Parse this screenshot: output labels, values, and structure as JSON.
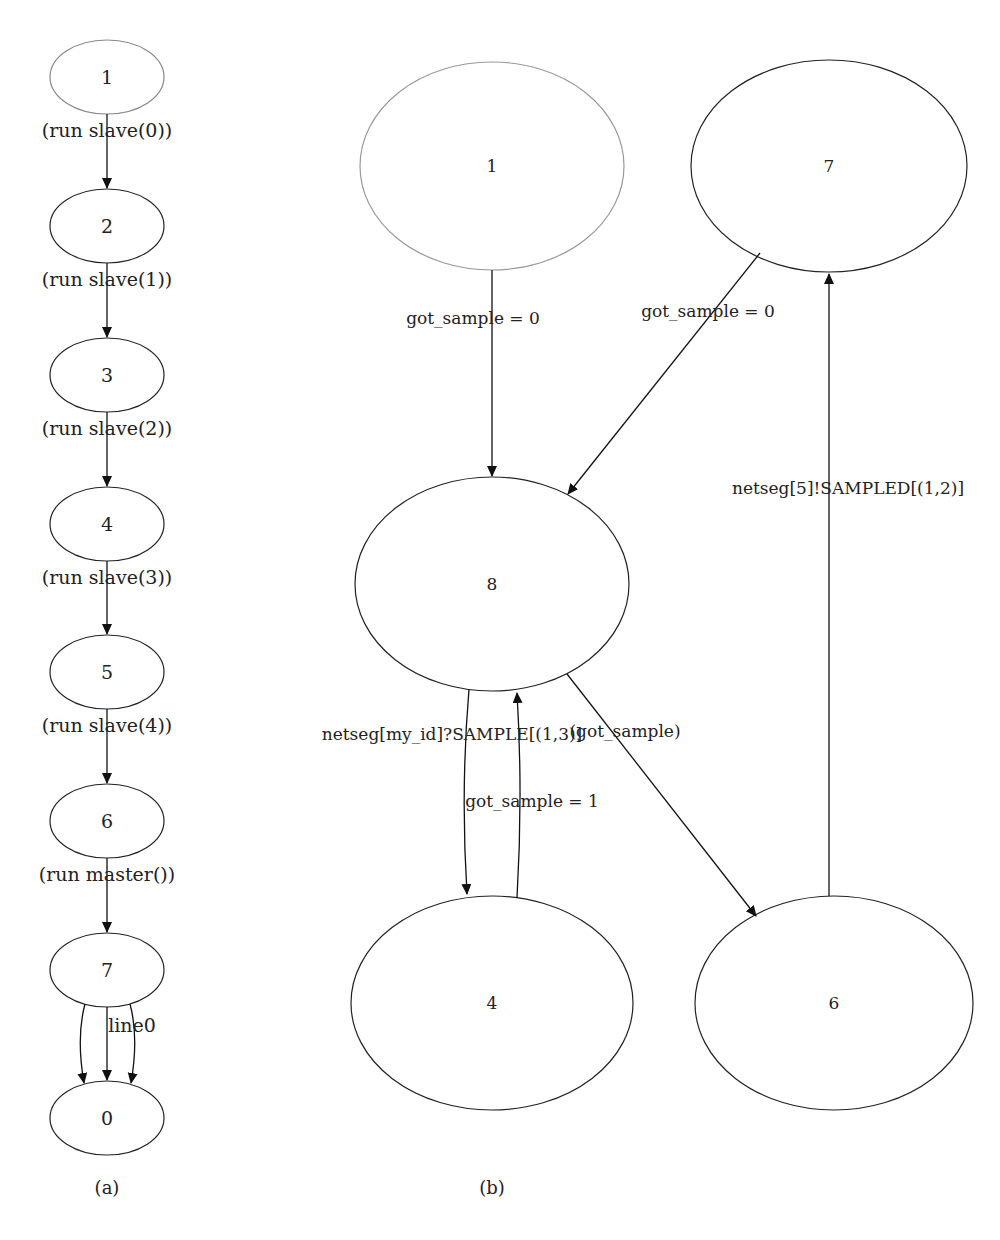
{
  "diagram_a": {
    "caption": "(a)",
    "nodes": [
      "1",
      "2",
      "3",
      "4",
      "5",
      "6",
      "7",
      "0"
    ],
    "edges": [
      {
        "from": "1",
        "to": "2",
        "label": "(run slave(0))"
      },
      {
        "from": "2",
        "to": "3",
        "label": "(run slave(1))"
      },
      {
        "from": "3",
        "to": "4",
        "label": "(run slave(2))"
      },
      {
        "from": "4",
        "to": "5",
        "label": "(run slave(3))"
      },
      {
        "from": "5",
        "to": "6",
        "label": "(run slave(4))"
      },
      {
        "from": "6",
        "to": "7",
        "label": "(run master())"
      },
      {
        "from": "7",
        "to": "0",
        "label": "line0"
      }
    ]
  },
  "diagram_b": {
    "caption": "(b)",
    "nodes": [
      "1",
      "7",
      "8",
      "4",
      "6"
    ],
    "edges": [
      {
        "from": "1",
        "to": "8",
        "label": "got_sample = 0"
      },
      {
        "from": "7",
        "to": "8",
        "label": "got_sample = 0"
      },
      {
        "from": "6",
        "to": "7",
        "label": "netseg[5]!SAMPLED[(1,2)]"
      },
      {
        "from": "8",
        "to": "4",
        "label": "netseg[my_id]?SAMPLE[(1,3)]"
      },
      {
        "from": "4",
        "to": "8",
        "label": "got_sample = 1"
      },
      {
        "from": "8",
        "to": "6",
        "label": "(got_sample)"
      }
    ]
  }
}
